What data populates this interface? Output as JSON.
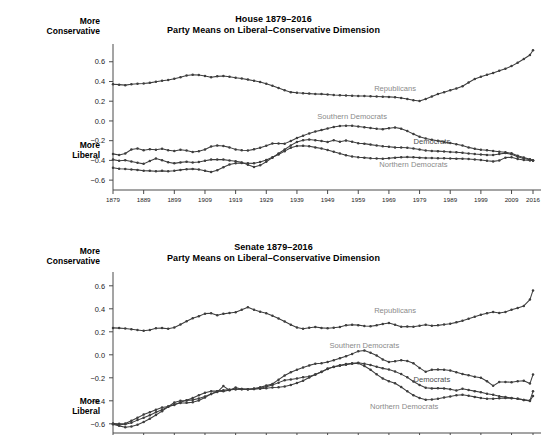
{
  "figure": {
    "background": "#ffffff",
    "line_color": "#3d3d3d",
    "label_color": "#8a8a8a",
    "axis_color": "#4a4a4a"
  },
  "axis_notes": {
    "more": "More",
    "conservative": "Conservative",
    "liberal": "Liberal"
  },
  "chart_data": [
    {
      "type": "line",
      "id": "house",
      "title": "House 1879–2016",
      "subtitle": "Party Means on Liberal–Conservative Dimension",
      "xlabel": "",
      "ylabel": "",
      "ylim": [
        -0.7,
        0.78
      ],
      "xlim": [
        1879,
        2016
      ],
      "grid": false,
      "legend_position": "inline-annotations",
      "yticks": [
        0.6,
        0.4,
        0.2,
        0.0,
        -0.2,
        -0.4,
        -0.6
      ],
      "yticklabels": [
        "0.6",
        "0.4",
        "0.2",
        "0.0",
        "−0.2",
        "−0.4",
        "−0.6"
      ],
      "xticks": [
        1879,
        1889,
        1899,
        1909,
        1919,
        1929,
        1939,
        1949,
        1959,
        1969,
        1979,
        1989,
        1999,
        2009,
        2016
      ],
      "xticklabels": [
        "1879",
        "1889",
        "1899",
        "1909",
        "1919",
        "1929",
        "1939",
        "1949",
        "1959",
        "1969",
        "1979",
        "1989",
        "1999",
        "2009",
        "2016"
      ],
      "x": [
        1879,
        1881,
        1883,
        1885,
        1887,
        1889,
        1891,
        1893,
        1895,
        1897,
        1899,
        1901,
        1903,
        1905,
        1907,
        1909,
        1911,
        1913,
        1915,
        1917,
        1919,
        1921,
        1923,
        1925,
        1927,
        1929,
        1931,
        1933,
        1935,
        1937,
        1939,
        1941,
        1943,
        1945,
        1947,
        1949,
        1951,
        1953,
        1955,
        1957,
        1959,
        1961,
        1963,
        1965,
        1967,
        1969,
        1971,
        1973,
        1975,
        1977,
        1979,
        1981,
        1983,
        1985,
        1987,
        1989,
        1991,
        1993,
        1995,
        1997,
        1999,
        2001,
        2003,
        2005,
        2007,
        2009,
        2011,
        2013,
        2015,
        2016
      ],
      "series": [
        {
          "name": "Republicans",
          "label_x": 1971,
          "label_y": 0.3,
          "label_style": "gray",
          "values": [
            0.373,
            0.368,
            0.363,
            0.372,
            0.378,
            0.379,
            0.386,
            0.398,
            0.407,
            0.415,
            0.428,
            0.444,
            0.46,
            0.468,
            0.466,
            0.456,
            0.443,
            0.452,
            0.456,
            0.447,
            0.437,
            0.43,
            0.419,
            0.408,
            0.394,
            0.377,
            0.356,
            0.333,
            0.31,
            0.292,
            0.285,
            0.281,
            0.277,
            0.273,
            0.272,
            0.269,
            0.264,
            0.261,
            0.258,
            0.256,
            0.253,
            0.252,
            0.25,
            0.248,
            0.246,
            0.244,
            0.24,
            0.232,
            0.222,
            0.209,
            0.203,
            0.222,
            0.248,
            0.273,
            0.292,
            0.31,
            0.33,
            0.352,
            0.39,
            0.425,
            0.447,
            0.468,
            0.487,
            0.508,
            0.53,
            0.556,
            0.59,
            0.628,
            0.668,
            0.716
          ]
        },
        {
          "name": "Southern Democrats",
          "label_x": 1957,
          "label_y": 0.02,
          "label_style": "gray",
          "values": [
            -0.334,
            -0.345,
            -0.33,
            -0.289,
            -0.28,
            -0.296,
            -0.286,
            -0.292,
            -0.282,
            -0.296,
            -0.304,
            -0.292,
            -0.3,
            -0.315,
            -0.308,
            -0.29,
            -0.259,
            -0.248,
            -0.253,
            -0.268,
            -0.29,
            -0.297,
            -0.3,
            -0.288,
            -0.272,
            -0.252,
            -0.228,
            -0.228,
            -0.23,
            -0.203,
            -0.172,
            -0.15,
            -0.126,
            -0.108,
            -0.093,
            -0.076,
            -0.062,
            -0.052,
            -0.048,
            -0.049,
            -0.056,
            -0.064,
            -0.072,
            -0.08,
            -0.083,
            -0.075,
            -0.066,
            -0.078,
            -0.103,
            -0.133,
            -0.16,
            -0.178,
            -0.19,
            -0.202,
            -0.214,
            -0.224,
            -0.236,
            -0.25,
            -0.268,
            -0.283,
            -0.292,
            -0.297,
            -0.305,
            -0.312,
            -0.318,
            -0.327,
            -0.352,
            -0.37,
            -0.388,
            -0.4
          ]
        },
        {
          "name": "Democrats",
          "label_x": 1983,
          "label_y": -0.23,
          "label_style": "dark",
          "values": [
            -0.392,
            -0.404,
            -0.398,
            -0.412,
            -0.424,
            -0.435,
            -0.406,
            -0.381,
            -0.398,
            -0.418,
            -0.43,
            -0.42,
            -0.414,
            -0.422,
            -0.417,
            -0.404,
            -0.392,
            -0.39,
            -0.392,
            -0.4,
            -0.408,
            -0.42,
            -0.444,
            -0.468,
            -0.45,
            -0.414,
            -0.372,
            -0.33,
            -0.29,
            -0.248,
            -0.214,
            -0.196,
            -0.188,
            -0.196,
            -0.203,
            -0.214,
            -0.196,
            -0.21,
            -0.198,
            -0.212,
            -0.226,
            -0.23,
            -0.24,
            -0.248,
            -0.256,
            -0.262,
            -0.268,
            -0.27,
            -0.272,
            -0.28,
            -0.29,
            -0.3,
            -0.304,
            -0.306,
            -0.31,
            -0.314,
            -0.318,
            -0.322,
            -0.33,
            -0.336,
            -0.34,
            -0.344,
            -0.346,
            -0.336,
            -0.326,
            -0.338,
            -0.362,
            -0.38,
            -0.394,
            -0.4
          ]
        },
        {
          "name": "Northern Democrats",
          "label_x": 1977,
          "label_y": -0.47,
          "label_style": "gray",
          "values": [
            -0.474,
            -0.484,
            -0.488,
            -0.492,
            -0.496,
            -0.504,
            -0.506,
            -0.51,
            -0.506,
            -0.51,
            -0.504,
            -0.496,
            -0.49,
            -0.486,
            -0.492,
            -0.506,
            -0.518,
            -0.5,
            -0.47,
            -0.442,
            -0.428,
            -0.426,
            -0.428,
            -0.43,
            -0.416,
            -0.396,
            -0.368,
            -0.34,
            -0.306,
            -0.272,
            -0.255,
            -0.252,
            -0.256,
            -0.268,
            -0.28,
            -0.294,
            -0.312,
            -0.33,
            -0.348,
            -0.36,
            -0.368,
            -0.372,
            -0.378,
            -0.38,
            -0.384,
            -0.378,
            -0.372,
            -0.368,
            -0.366,
            -0.368,
            -0.372,
            -0.376,
            -0.376,
            -0.378,
            -0.378,
            -0.38,
            -0.382,
            -0.384,
            -0.386,
            -0.39,
            -0.396,
            -0.404,
            -0.41,
            -0.4,
            -0.372,
            -0.368,
            -0.386,
            -0.396,
            -0.4,
            -0.402
          ]
        }
      ]
    },
    {
      "type": "line",
      "id": "senate",
      "title": "Senate 1879–2016",
      "subtitle": "Party Means on Liberal–Conservative Dimension",
      "xlabel": "",
      "ylabel": "",
      "ylim": [
        -0.68,
        0.72
      ],
      "xlim": [
        1879,
        2016
      ],
      "grid": false,
      "legend_position": "inline-annotations",
      "yticks": [
        0.6,
        0.4,
        0.2,
        0.0,
        -0.2,
        -0.4,
        -0.6
      ],
      "yticklabels": [
        "0.6",
        "0.4",
        "0.2",
        "0.0",
        "−0.2",
        "−0.4",
        "−0.6"
      ],
      "xticks": [
        1879,
        1889,
        1899,
        1909,
        1919,
        1929,
        1939,
        1949,
        1959,
        1969,
        1979,
        1989,
        1999,
        2009,
        2016
      ],
      "xticklabels": [],
      "x": [
        1879,
        1881,
        1883,
        1885,
        1887,
        1889,
        1891,
        1893,
        1895,
        1897,
        1899,
        1901,
        1903,
        1905,
        1907,
        1909,
        1911,
        1913,
        1915,
        1917,
        1919,
        1921,
        1923,
        1925,
        1927,
        1929,
        1931,
        1933,
        1935,
        1937,
        1939,
        1941,
        1943,
        1945,
        1947,
        1949,
        1951,
        1953,
        1955,
        1957,
        1959,
        1961,
        1963,
        1965,
        1967,
        1969,
        1971,
        1973,
        1975,
        1977,
        1979,
        1981,
        1983,
        1985,
        1987,
        1989,
        1991,
        1993,
        1995,
        1997,
        1999,
        2001,
        2003,
        2005,
        2007,
        2009,
        2011,
        2013,
        2015,
        2016
      ],
      "series": [
        {
          "name": "Republicans",
          "label_x": 1971,
          "label_y": 0.365,
          "label_style": "gray",
          "values": [
            0.234,
            0.232,
            0.228,
            0.222,
            0.215,
            0.21,
            0.216,
            0.23,
            0.232,
            0.226,
            0.238,
            0.264,
            0.292,
            0.318,
            0.336,
            0.358,
            0.362,
            0.344,
            0.356,
            0.364,
            0.37,
            0.392,
            0.414,
            0.392,
            0.374,
            0.362,
            0.34,
            0.316,
            0.29,
            0.262,
            0.238,
            0.226,
            0.236,
            0.242,
            0.234,
            0.23,
            0.236,
            0.242,
            0.256,
            0.262,
            0.258,
            0.25,
            0.248,
            0.256,
            0.268,
            0.276,
            0.262,
            0.244,
            0.246,
            0.244,
            0.252,
            0.262,
            0.252,
            0.256,
            0.264,
            0.27,
            0.282,
            0.296,
            0.314,
            0.33,
            0.348,
            0.362,
            0.372,
            0.364,
            0.372,
            0.392,
            0.408,
            0.425,
            0.48,
            0.56
          ]
        },
        {
          "name": "Southern Democrats",
          "label_x": 1961,
          "label_y": 0.06,
          "label_style": "gray",
          "values": [
            -0.598,
            -0.6,
            -0.598,
            -0.574,
            -0.548,
            -0.52,
            -0.5,
            -0.478,
            -0.458,
            -0.45,
            -0.436,
            -0.412,
            -0.396,
            -0.376,
            -0.352,
            -0.33,
            -0.316,
            -0.316,
            -0.318,
            -0.306,
            -0.3,
            -0.298,
            -0.3,
            -0.294,
            -0.282,
            -0.268,
            -0.254,
            -0.216,
            -0.18,
            -0.152,
            -0.13,
            -0.11,
            -0.092,
            -0.078,
            -0.074,
            -0.062,
            -0.048,
            -0.03,
            -0.012,
            0.008,
            0.03,
            0.038,
            0.018,
            -0.006,
            -0.04,
            -0.062,
            -0.056,
            -0.048,
            -0.054,
            -0.074,
            -0.114,
            -0.148,
            -0.13,
            -0.128,
            -0.13,
            -0.136,
            -0.152,
            -0.168,
            -0.178,
            -0.19,
            -0.2,
            -0.23,
            -0.27,
            -0.236,
            -0.236,
            -0.238,
            -0.23,
            -0.226,
            -0.25,
            -0.172
          ]
        },
        {
          "name": "Democrats",
          "label_x": 1983,
          "label_y": -0.238,
          "label_style": "dark",
          "values": [
            -0.602,
            -0.608,
            -0.604,
            -0.59,
            -0.568,
            -0.548,
            -0.526,
            -0.5,
            -0.478,
            -0.452,
            -0.43,
            -0.42,
            -0.418,
            -0.412,
            -0.398,
            -0.372,
            -0.34,
            -0.316,
            -0.308,
            -0.302,
            -0.3,
            -0.298,
            -0.3,
            -0.298,
            -0.29,
            -0.278,
            -0.262,
            -0.242,
            -0.222,
            -0.214,
            -0.206,
            -0.196,
            -0.188,
            -0.172,
            -0.15,
            -0.124,
            -0.104,
            -0.09,
            -0.08,
            -0.074,
            -0.07,
            -0.078,
            -0.088,
            -0.104,
            -0.118,
            -0.128,
            -0.146,
            -0.168,
            -0.196,
            -0.232,
            -0.262,
            -0.286,
            -0.292,
            -0.29,
            -0.292,
            -0.3,
            -0.31,
            -0.296,
            -0.306,
            -0.316,
            -0.326,
            -0.338,
            -0.348,
            -0.36,
            -0.368,
            -0.376,
            -0.382,
            -0.392,
            -0.398,
            -0.318
          ]
        },
        {
          "name": "Northern Democrats",
          "label_x": 1974,
          "label_y": -0.475,
          "label_style": "gray",
          "values": [
            -0.604,
            -0.618,
            -0.63,
            -0.624,
            -0.608,
            -0.584,
            -0.556,
            -0.524,
            -0.49,
            -0.452,
            -0.414,
            -0.4,
            -0.398,
            -0.392,
            -0.38,
            -0.362,
            -0.34,
            -0.324,
            -0.272,
            -0.308,
            -0.284,
            -0.3,
            -0.3,
            -0.298,
            -0.296,
            -0.29,
            -0.284,
            -0.282,
            -0.276,
            -0.262,
            -0.246,
            -0.226,
            -0.198,
            -0.172,
            -0.148,
            -0.12,
            -0.106,
            -0.096,
            -0.086,
            -0.078,
            -0.074,
            -0.098,
            -0.13,
            -0.17,
            -0.206,
            -0.23,
            -0.248,
            -0.28,
            -0.318,
            -0.352,
            -0.376,
            -0.39,
            -0.388,
            -0.382,
            -0.372,
            -0.362,
            -0.352,
            -0.348,
            -0.356,
            -0.366,
            -0.376,
            -0.382,
            -0.382,
            -0.378,
            -0.376,
            -0.378,
            -0.382,
            -0.392,
            -0.402,
            -0.358
          ]
        }
      ]
    }
  ]
}
